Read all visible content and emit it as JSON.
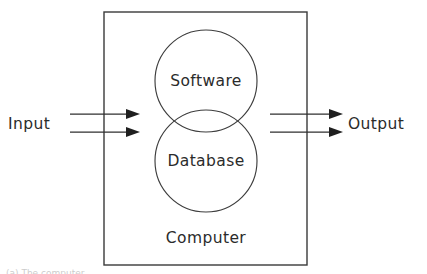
{
  "figure": {
    "kind": "block-diagram",
    "background_color": "#ffffff",
    "line_color": "#3a3a3a",
    "text_color": "#2b2b2b"
  },
  "outer_block": {
    "label": "Computer",
    "x": 104,
    "y": 12,
    "width": 203,
    "height": 253,
    "label_x": 206,
    "label_y": 238
  },
  "components": [
    {
      "label": "Software",
      "shape": "circle",
      "cx": 206,
      "cy": 81,
      "r": 51
    },
    {
      "label": "Database",
      "shape": "circle",
      "cx": 206,
      "cy": 161,
      "r": 51
    }
  ],
  "flows": {
    "input": {
      "label": "Input",
      "label_x": 8,
      "label_y": 124,
      "count": 2,
      "arrows": [
        {
          "x1": 70,
          "y1": 114,
          "x2": 140,
          "y2": 114
        },
        {
          "x1": 70,
          "y1": 132,
          "x2": 140,
          "y2": 132
        }
      ]
    },
    "output": {
      "label": "Output",
      "label_x": 348,
      "label_y": 124,
      "count": 2,
      "arrows": [
        {
          "x1": 270,
          "y1": 114,
          "x2": 343,
          "y2": 114
        },
        {
          "x1": 270,
          "y1": 132,
          "x2": 343,
          "y2": 132
        }
      ]
    }
  },
  "caption_sliver": {
    "text": "(a) The computer"
  }
}
